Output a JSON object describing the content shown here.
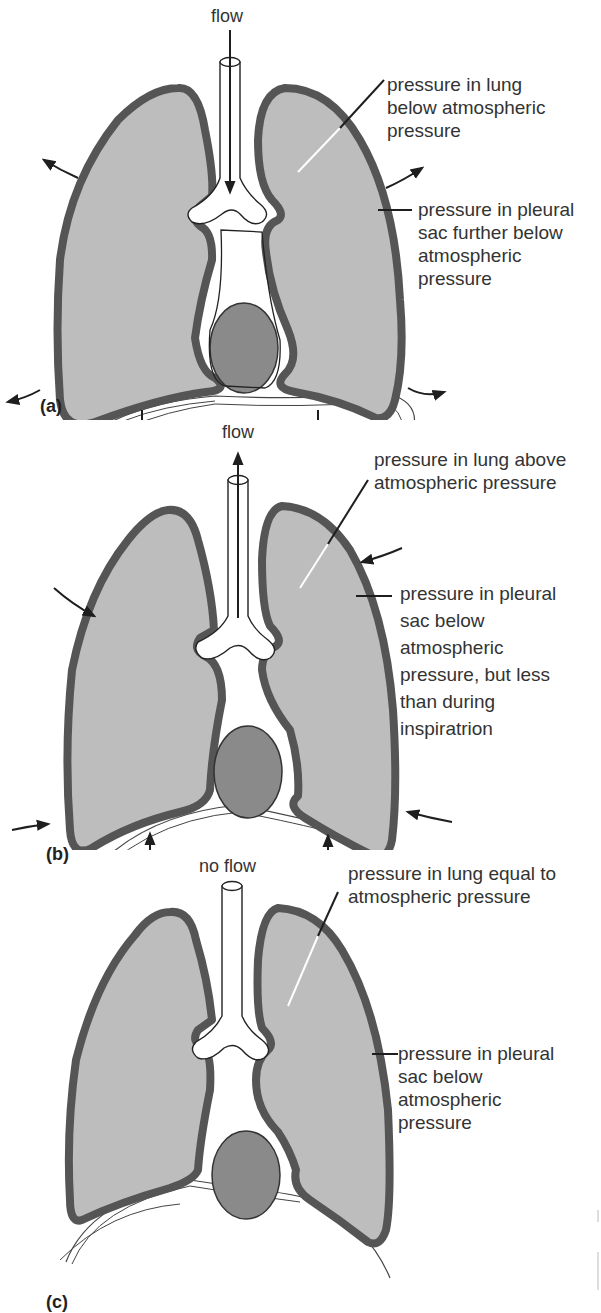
{
  "figure": {
    "colors": {
      "lung_fill": "#bdbdbd",
      "pleura_wall": "#555555",
      "heart_fill": "#8a8a8a",
      "airway": "#ffffff",
      "outline": "#1e1e1e"
    },
    "panels": [
      {
        "id": "a",
        "label": "(a)",
        "flow_label": "flow",
        "flow_direction": "in",
        "lung_annotation": [
          "pressure in lung",
          "below atmospheric",
          "pressure"
        ],
        "pleural_annotation": [
          "pressure in pleural",
          "sac further below",
          "atmospheric",
          "pressure"
        ],
        "chest_arrows": "outward",
        "diaphragm_arrows": "down"
      },
      {
        "id": "b",
        "label": "(b)",
        "flow_label": "flow",
        "flow_direction": "out",
        "lung_annotation": [
          "pressure in lung above",
          "atmospheric pressure"
        ],
        "pleural_annotation": [
          "pressure in pleural",
          "sac below",
          "atmospheric",
          "pressure, but less",
          "than during",
          "inspiratrion"
        ],
        "chest_arrows": "inward",
        "diaphragm_arrows": "up"
      },
      {
        "id": "c",
        "label": "(c)",
        "flow_label": "no flow",
        "flow_direction": "none",
        "lung_annotation": [
          "pressure in lung equal to",
          "atmospheric pressure"
        ],
        "pleural_annotation": [
          "pressure in pleural",
          "sac below",
          "atmospheric",
          "pressure"
        ],
        "chest_arrows": "none",
        "diaphragm_arrows": "none"
      }
    ]
  }
}
